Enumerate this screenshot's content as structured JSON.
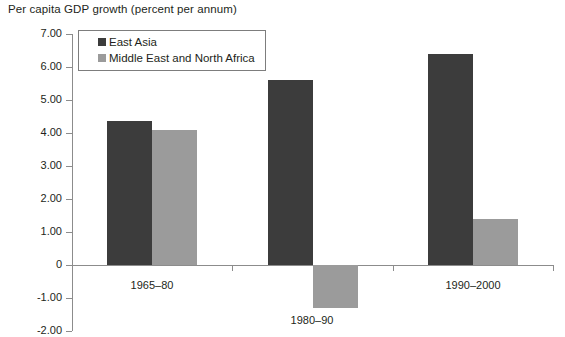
{
  "chart_data": {
    "type": "bar",
    "title": "Per capita GDP growth (percent per annum)",
    "xlabel": "",
    "ylabel": "",
    "categories": [
      "1965–80",
      "1980–90",
      "1990–2000"
    ],
    "series": [
      {
        "name": "East Asia",
        "values": [
          4.35,
          5.6,
          6.4
        ],
        "color": "#3c3c3c"
      },
      {
        "name": "Middle East and North Africa",
        "values": [
          4.1,
          -1.3,
          1.4
        ],
        "color": "#9b9b9b"
      }
    ],
    "ylim": [
      -2.0,
      7.0
    ],
    "ytick_labels": [
      "7.00",
      "6.00",
      "5.00",
      "4.00",
      "3.00",
      "2.00",
      "1.00",
      "0",
      "-1.00",
      "-2.00"
    ],
    "ytick_values": [
      7,
      6,
      5,
      4,
      3,
      2,
      1,
      0,
      -1,
      -2
    ],
    "grid": false,
    "legend_position": "top-left"
  },
  "legend": {
    "entries": [
      {
        "label": "East Asia"
      },
      {
        "label": "Middle East and North Africa"
      }
    ]
  }
}
